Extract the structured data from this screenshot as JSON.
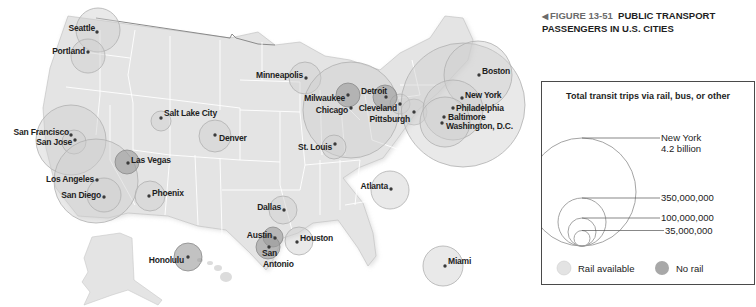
{
  "caption": {
    "arrow": "◀",
    "figure_number": "FIGURE 13-51",
    "title": "PUBLIC TRANSPORT PASSENGERS IN U.S. CITIES"
  },
  "legend": {
    "title": "Total transit trips via rail, bus, or other",
    "scale": [
      {
        "label_line1": "New York",
        "label_line2": "4.2 billion",
        "value": 4200000000
      },
      {
        "label_line1": "350,000,000",
        "value": 350000000
      },
      {
        "label_line1": "100,000,000",
        "value": 100000000
      },
      {
        "label_line1": "35,000,000",
        "value": 35000000
      }
    ],
    "categories": [
      {
        "label": "Rail available",
        "color": "#e3e3e3"
      },
      {
        "label": "No rail",
        "color": "#a8a8a8"
      }
    ]
  },
  "colors": {
    "land": "#e4e4e4",
    "state_border": "#ffffff",
    "rail_circle": "#cfcfcf",
    "no_rail_circle": "#9a9a9a",
    "dot": "#3a3a3a"
  },
  "cities": [
    {
      "name": "Seattle",
      "rail": true
    },
    {
      "name": "Portland",
      "rail": true
    },
    {
      "name": "San Francisco",
      "rail": true
    },
    {
      "name": "San Jose",
      "rail": true
    },
    {
      "name": "Las Vegas",
      "rail": false
    },
    {
      "name": "Los Angeles",
      "rail": true
    },
    {
      "name": "San Diego",
      "rail": true
    },
    {
      "name": "Phoenix",
      "rail": true
    },
    {
      "name": "Salt Lake City",
      "rail": true
    },
    {
      "name": "Denver",
      "rail": true
    },
    {
      "name": "Honolulu",
      "rail": false
    },
    {
      "name": "Minneapolis",
      "rail": true
    },
    {
      "name": "Milwaukee",
      "rail": false
    },
    {
      "name": "Chicago",
      "rail": true
    },
    {
      "name": "Detroit",
      "rail": false
    },
    {
      "name": "Cleveland",
      "rail": true
    },
    {
      "name": "Pittsburgh",
      "rail": true
    },
    {
      "name": "St. Louis",
      "rail": true
    },
    {
      "name": "Boston",
      "rail": true
    },
    {
      "name": "New York",
      "rail": true
    },
    {
      "name": "Philadelphia",
      "rail": true
    },
    {
      "name": "Baltimore",
      "rail": true
    },
    {
      "name": "Washington, D.C.",
      "rail": true
    },
    {
      "name": "Atlanta",
      "rail": true
    },
    {
      "name": "Dallas",
      "rail": true
    },
    {
      "name": "Austin",
      "rail": false
    },
    {
      "name": "San",
      "rail": false
    },
    {
      "name": "Antonio",
      "rail": false
    },
    {
      "name": "Houston",
      "rail": true
    },
    {
      "name": "Miami",
      "rail": true
    }
  ]
}
